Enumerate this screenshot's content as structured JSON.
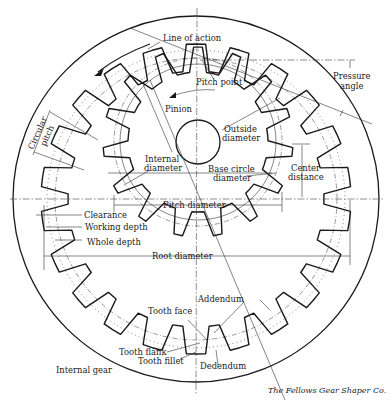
{
  "figure": {
    "credit": "The Fellows Gear Shaper Co."
  },
  "geometry": {
    "internal_gear": {
      "cx": 196,
      "cy": 199,
      "outer_radius": 183,
      "root_radius": 155,
      "tip_radius": 128,
      "pitch_radius": 141,
      "teeth": 22
    },
    "pinion": {
      "cx": 198,
      "cy": 142,
      "tip_radius": 95,
      "root_radius": 70,
      "pitch_radius": 84,
      "base_radius": 78,
      "teeth": 15,
      "hub_radius": 22
    }
  },
  "labels": {
    "line_of_action": "Line of action",
    "pressure_angle_1": "Pressure",
    "pressure_angle_2": "angle",
    "pitch_point": "Pitch point",
    "pinion": "Pinion",
    "outside_diameter_1": "Outside",
    "outside_diameter_2": "diameter",
    "circular_pitch_1": "Circular",
    "circular_pitch_2": "pitch",
    "internal_diameter_1": "Internal",
    "internal_diameter_2": "diameter",
    "base_circle_1": "Base circle",
    "base_circle_2": "diameter",
    "center_distance_1": "Center",
    "center_distance_2": "distance",
    "pitch_diameter": "Pitch diameter",
    "clearance": "Clearance",
    "working_depth": "Working depth",
    "whole_depth": "Whole depth",
    "root_diameter": "Root diameter",
    "addendum": "Addendum",
    "tooth_face": "Tooth face",
    "tooth_flank": "Tooth flank",
    "tooth_fillet": "Tooth fillet",
    "dedendum": "Dedendum",
    "internal_gear": "Internal gear"
  }
}
